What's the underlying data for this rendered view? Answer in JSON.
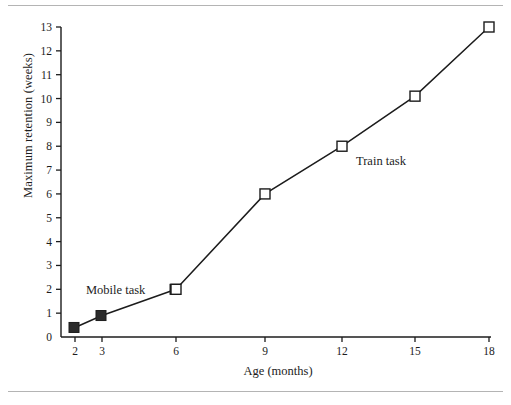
{
  "chart_data": {
    "type": "line",
    "title": "",
    "subtitle": "",
    "xlabel": "Age (months)",
    "ylabel": "Maximum retention (weeks)",
    "x_categories": [
      "2",
      "3",
      "6",
      "9",
      "12",
      "15",
      "18"
    ],
    "x_tick_labels": [
      "2",
      "3",
      "6",
      "9",
      "12",
      "15",
      "18"
    ],
    "y_tick_labels": [
      "0",
      "1",
      "2",
      "3",
      "4",
      "5",
      "6",
      "7",
      "8",
      "9",
      "10",
      "11",
      "12",
      "13"
    ],
    "ylim": [
      0,
      13
    ],
    "grid": false,
    "legend_position": "inline-annotation",
    "series": [
      {
        "name": "Mobile task",
        "marker": "filled-square",
        "color": "#1c1c1c",
        "label_text": "Mobile task",
        "points": [
          {
            "x": "2",
            "y": 0.4
          },
          {
            "x": "3",
            "y": 0.9
          },
          {
            "x": "6",
            "y": 2.0
          }
        ]
      },
      {
        "name": "Train task",
        "marker": "open-square",
        "color": "#1c1c1c",
        "label_text": "Train task",
        "points": [
          {
            "x": "6",
            "y": 2.0
          },
          {
            "x": "9",
            "y": 6.0
          },
          {
            "x": "12",
            "y": 8.0
          },
          {
            "x": "15",
            "y": 10.1
          },
          {
            "x": "18",
            "y": 13.0
          }
        ]
      }
    ],
    "annotations": [
      {
        "text": "Mobile task",
        "x": "between-2-and-3",
        "y": 2.2
      },
      {
        "text": "Train task",
        "x": "right-of-12",
        "y": 7.6
      }
    ],
    "colors": {
      "axis": "#1c1c1c",
      "line": "#1c1c1c",
      "filled_marker": "#2b2b2b",
      "open_marker_fill": "#ffffff",
      "rule": "#b4b4b4",
      "background": "#ffffff"
    }
  }
}
